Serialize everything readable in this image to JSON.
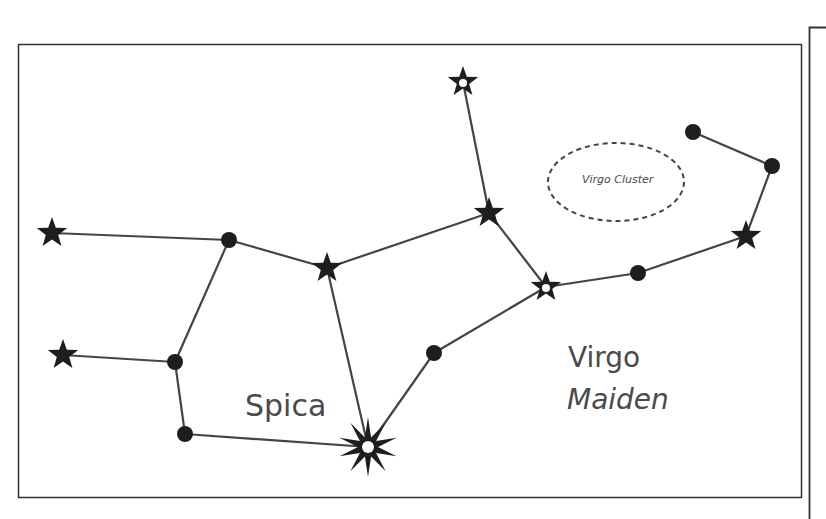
{
  "diagram": {
    "labels": {
      "star_name": "Spica",
      "constellation_name": "Virgo",
      "constellation_meaning": "Maiden",
      "deep_sky_object": "Virgo Cluster"
    },
    "colors": {
      "line": "#444444",
      "star": "#1e1e1e",
      "text": "#4a4a4a",
      "frame": "#333333"
    },
    "stars": [
      {
        "id": "A",
        "type": "star",
        "x": 52,
        "y": 233
      },
      {
        "id": "B",
        "type": "dot",
        "x": 229,
        "y": 240
      },
      {
        "id": "C",
        "type": "star",
        "x": 327,
        "y": 268
      },
      {
        "id": "D",
        "type": "star",
        "x": 489,
        "y": 213
      },
      {
        "id": "E",
        "type": "star-hollow",
        "x": 463,
        "y": 82
      },
      {
        "id": "F",
        "type": "star-hollow",
        "x": 546,
        "y": 287
      },
      {
        "id": "G",
        "type": "dot",
        "x": 638,
        "y": 273
      },
      {
        "id": "H",
        "type": "star",
        "x": 746,
        "y": 236
      },
      {
        "id": "I",
        "type": "dot",
        "x": 772,
        "y": 166
      },
      {
        "id": "J",
        "type": "dot",
        "x": 693,
        "y": 132
      },
      {
        "id": "K",
        "type": "star",
        "x": 63,
        "y": 355
      },
      {
        "id": "L",
        "type": "dot",
        "x": 175,
        "y": 362
      },
      {
        "id": "M",
        "type": "dot",
        "x": 185,
        "y": 434
      },
      {
        "id": "Spica",
        "type": "bright-star",
        "x": 368,
        "y": 447
      },
      {
        "id": "N",
        "type": "dot",
        "x": 434,
        "y": 353
      }
    ],
    "connections": [
      [
        "A",
        "B"
      ],
      [
        "B",
        "C"
      ],
      [
        "C",
        "D"
      ],
      [
        "D",
        "E"
      ],
      [
        "D",
        "F"
      ],
      [
        "F",
        "G"
      ],
      [
        "G",
        "H"
      ],
      [
        "H",
        "I"
      ],
      [
        "I",
        "J"
      ],
      [
        "B",
        "L"
      ],
      [
        "K",
        "L"
      ],
      [
        "L",
        "M"
      ],
      [
        "M",
        "Spica"
      ],
      [
        "C",
        "Spica"
      ],
      [
        "Spica",
        "N"
      ],
      [
        "N",
        "F"
      ]
    ]
  }
}
